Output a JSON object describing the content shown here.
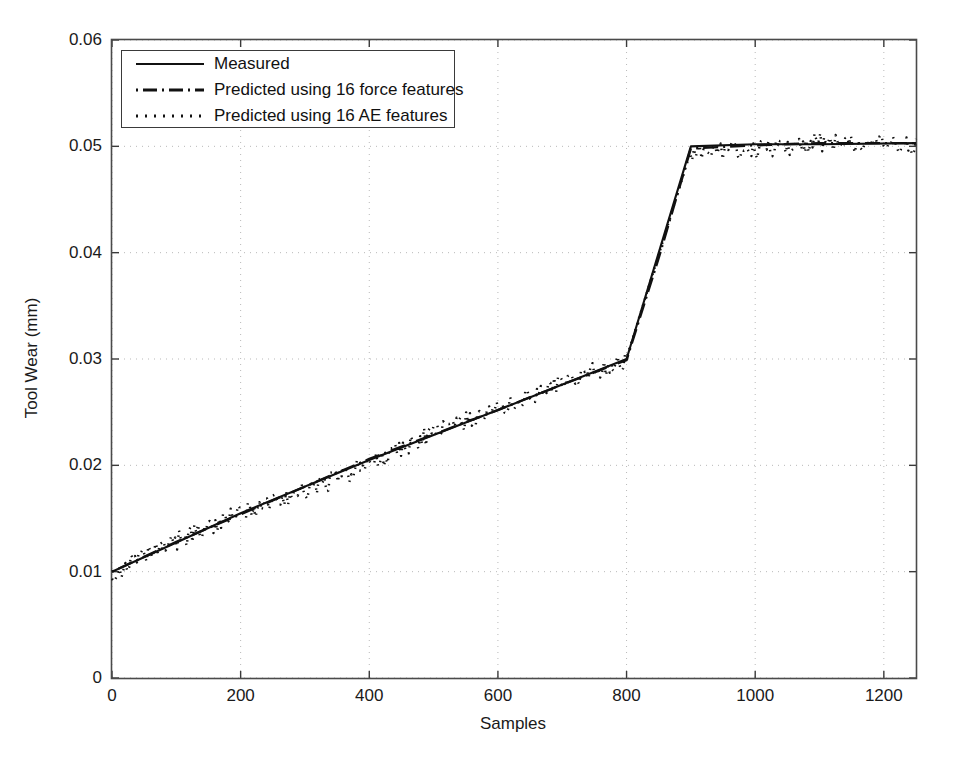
{
  "chart_data": {
    "type": "line",
    "title": "",
    "xlabel": "Samples",
    "ylabel": "Tool Wear (mm)",
    "xlim": [
      0,
      1250
    ],
    "ylim": [
      0,
      0.06
    ],
    "xticks": [
      0,
      200,
      400,
      600,
      800,
      1000,
      1200
    ],
    "xtick_labels": [
      "0",
      "200",
      "400",
      "600",
      "800",
      "1000",
      "1200"
    ],
    "yticks": [
      0,
      0.01,
      0.02,
      0.03,
      0.04,
      0.05,
      0.06
    ],
    "ytick_labels": [
      "0",
      "0.01",
      "0.02",
      "0.03",
      "0.04",
      "0.05",
      "0.06"
    ],
    "grid": true,
    "grid_style": "dotted",
    "grid_color": "#b9b9b9",
    "legend_position": "upper-left",
    "series": [
      {
        "name": "Measured",
        "style": "solid",
        "color": "#111111",
        "x": [
          0,
          200,
          400,
          600,
          800,
          900,
          1000,
          1100,
          1250
        ],
        "values": [
          0.01,
          0.0155,
          0.0205,
          0.0252,
          0.03,
          0.05,
          0.0502,
          0.0502,
          0.0503
        ]
      },
      {
        "name": "Predicted using 16 force features",
        "style": "dashdot",
        "color": "#111111",
        "x": [
          0,
          100,
          200,
          300,
          400,
          500,
          600,
          700,
          800,
          850,
          900,
          1000,
          1100,
          1250
        ],
        "values": [
          0.01,
          0.0128,
          0.0154,
          0.018,
          0.0206,
          0.0229,
          0.0252,
          0.0276,
          0.0299,
          0.0395,
          0.0498,
          0.0501,
          0.0503,
          0.0503
        ]
      },
      {
        "name": "Predicted using 16 AE features",
        "style": "dotted",
        "color": "#111111",
        "x": [
          0,
          100,
          200,
          300,
          400,
          500,
          600,
          700,
          800,
          850,
          900,
          1000,
          1100,
          1250
        ],
        "values": [
          0.01,
          0.0131,
          0.0157,
          0.0178,
          0.0203,
          0.0233,
          0.0254,
          0.0281,
          0.0301,
          0.0398,
          0.0496,
          0.0499,
          0.0506,
          0.0502
        ],
        "noisy": true,
        "noise_amplitude": 0.0008
      }
    ],
    "annotations": {
      "knee_x": 800,
      "knee_y": 0.03,
      "plateau_start_x": 900,
      "plateau_y": 0.05,
      "start_y": 0.01
    }
  },
  "legend": {
    "items": [
      {
        "label": "Measured",
        "style": "solid"
      },
      {
        "label": "Predicted using 16 force features",
        "style": "dashdot"
      },
      {
        "label": "Predicted using 16 AE features",
        "style": "dotted"
      }
    ]
  }
}
